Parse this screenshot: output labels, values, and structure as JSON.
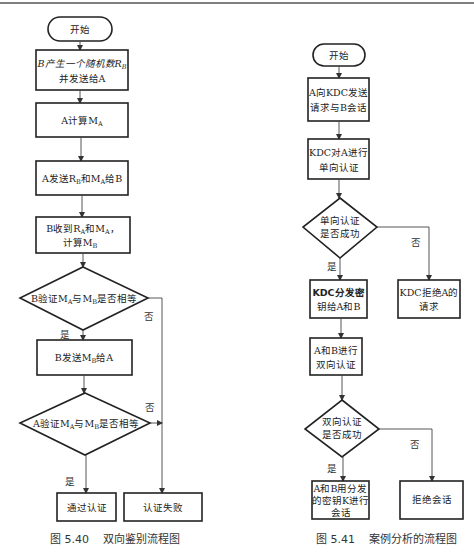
{
  "left_chart": {
    "caption": "图 5.40    双向鉴别流程图",
    "start": "开始",
    "step1_line1": "B产生一个随机数R",
    "step1_sub1": "B",
    "step1_line2": "并发送给A",
    "step2": "A计算M",
    "step2_sub": "A",
    "step3": "A发送R",
    "step3_sub1": "B",
    "step3_mid": "和M",
    "step3_sub2": "A",
    "step3_end": "给B",
    "step4_line1": "B收到R",
    "step4_sub1": "A",
    "step4_mid": "和M",
    "step4_sub2": "A",
    "step4_end": "，",
    "step4_line2": "计算M",
    "step4_sub3": "B",
    "decision1_pre": "B验证M",
    "decision1_sub1": "A",
    "decision1_mid": "与M",
    "decision1_sub2": "B",
    "decision1_end": "是否相等",
    "step5": "B发送M",
    "step5_sub": "B",
    "step5_end": "给A",
    "decision2_pre": "A验证M",
    "decision2_sub1": "A",
    "decision2_mid": "与M",
    "decision2_sub2": "B",
    "decision2_end": "是否相等",
    "result_pass": "通过认证",
    "result_fail": "认证失败",
    "yes": "是",
    "no": "否"
  },
  "right_chart": {
    "caption": "图 5.41    案例分析的流程图",
    "start": "开始",
    "step1_line1": "A向KDC发送",
    "step1_line2": "请求与B会话",
    "step2_line1": "KDC对A进行",
    "step2_line2": "单向认证",
    "decision1_line1": "单向认证",
    "decision1_line2": "是否成功",
    "step3_line1": "KDC分发密",
    "step3_line2": "钥给A和B",
    "reject1_line1": "KDC拒绝A的",
    "reject1_line2": "请求",
    "step4_line1": "A和B进行",
    "step4_line2": "双向认证",
    "decision2_line1": "双向认证",
    "decision2_line2": "是否成功",
    "step5_line1": "A和B用分发",
    "step5_line2": "的密钥K进行",
    "step5_line3": "会话",
    "reject2": "拒绝会话",
    "yes": "是",
    "no": "否"
  }
}
